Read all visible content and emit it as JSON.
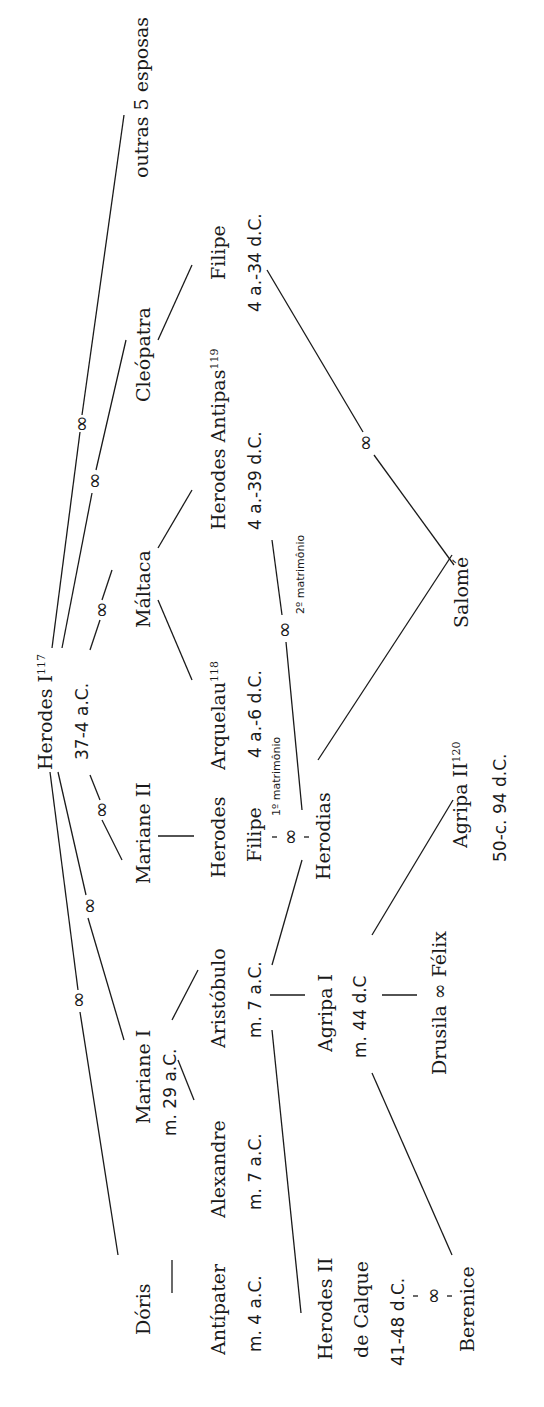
{
  "diagram": {
    "type": "genealogy-tree",
    "orientation": "rotated-90-ccw",
    "marriage_symbol": "∞",
    "root": {
      "name": "Herodes I",
      "note": "117",
      "dates": "37-4 a.C."
    },
    "spouses": [
      {
        "name": "Dóris"
      },
      {
        "name": "Mariane I",
        "dates": "m. 29 a.C."
      },
      {
        "name": "Mariane II"
      },
      {
        "name": "Máltaca"
      },
      {
        "name": "Cleópatra"
      },
      {
        "name": "outras 5 esposas"
      }
    ],
    "children": [
      {
        "name": "Antípater",
        "dates": "m. 4 a.C."
      },
      {
        "name": "Alexandre",
        "dates": "m. 7 a.C."
      },
      {
        "name": "Aristóbulo",
        "dates": "m. 7 a.C."
      },
      {
        "name": "Herodes Filipe"
      },
      {
        "name": "Arquelau",
        "note": "118",
        "dates": "4 a.-6 d.C."
      },
      {
        "name": "Herodes Antipas",
        "note": "119",
        "dates": "4 a.-39 d.C."
      },
      {
        "name": "Filipe",
        "dates": "4 a.-34 d.C."
      }
    ],
    "grandchildren": [
      {
        "name": "Herodes II",
        "line2": "de Calque",
        "dates": "41-48 d.C."
      },
      {
        "name": "Agripa I",
        "dates": "m. 44 d.C"
      },
      {
        "name": "Herodias"
      },
      {
        "name": "Salomé"
      }
    ],
    "great_grandchildren": [
      {
        "name": "Berenice"
      },
      {
        "name": "Drusila ∞ Félix"
      },
      {
        "name": "Agripa II",
        "note": "120",
        "dates": "50-c. 94 d.C."
      }
    ],
    "marriage_labels": {
      "first": "1º matrimônio",
      "second": "2º matrimônio"
    }
  }
}
